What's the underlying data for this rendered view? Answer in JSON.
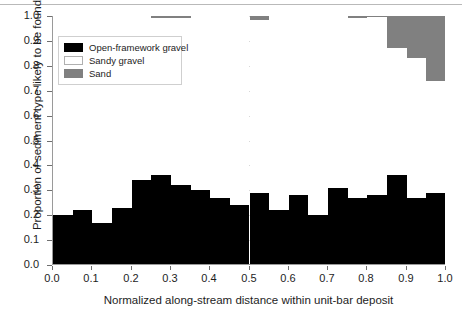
{
  "chart_data": {
    "type": "bar",
    "title": "",
    "subtitle": "",
    "xlabel": "Normalized along-stream distance within unit-bar deposit",
    "ylabel": "Proportion of sediment type likely to be found",
    "xlim": [
      0.0,
      1.0
    ],
    "ylim": [
      0.0,
      1.0
    ],
    "grid": true,
    "stacked": true,
    "legend_position": "upper-left-inside",
    "bar_count": 20,
    "bin_width": 0.05,
    "x_tick_labels": [
      "0.0",
      "0.1",
      "0.2",
      "0.3",
      "0.4",
      "0.5",
      "0.6",
      "0.7",
      "0.8",
      "0.9",
      "1.0"
    ],
    "x_tick_values": [
      0.0,
      0.1,
      0.2,
      0.3,
      0.4,
      0.5,
      0.6,
      0.7,
      0.8,
      0.9,
      1.0
    ],
    "y_tick_labels": [
      "0.0",
      "0.1",
      "0.2",
      "0.3",
      "0.4",
      "0.5",
      "0.6",
      "0.7",
      "0.8",
      "0.9",
      "1.0"
    ],
    "y_tick_values": [
      0.0,
      0.1,
      0.2,
      0.3,
      0.4,
      0.5,
      0.6,
      0.7,
      0.8,
      0.9,
      1.0
    ],
    "bin_centers": [
      0.025,
      0.075,
      0.125,
      0.175,
      0.225,
      0.275,
      0.325,
      0.375,
      0.425,
      0.475,
      0.525,
      0.575,
      0.625,
      0.675,
      0.725,
      0.775,
      0.825,
      0.875,
      0.925,
      0.975
    ],
    "bin_edges": [
      0.0,
      0.05,
      0.1,
      0.15,
      0.2,
      0.25,
      0.3,
      0.35,
      0.4,
      0.45,
      0.5,
      0.55,
      0.6,
      0.65,
      0.7,
      0.75,
      0.8,
      0.85,
      0.9,
      0.95,
      1.0
    ],
    "series": [
      {
        "name": "Open-framework gravel",
        "color": "#000000",
        "values": [
          0.2,
          0.22,
          0.17,
          0.23,
          0.34,
          0.36,
          0.32,
          0.3,
          0.27,
          0.24,
          0.29,
          0.22,
          0.28,
          0.2,
          0.31,
          0.27,
          0.28,
          0.36,
          0.27,
          0.29
        ]
      },
      {
        "name": "Sandy gravel",
        "color": "#ffffff",
        "values": [
          0.8,
          0.78,
          0.83,
          0.77,
          0.66,
          0.63,
          0.67,
          0.7,
          0.73,
          0.76,
          0.695,
          0.78,
          0.72,
          0.8,
          0.69,
          0.72,
          0.715,
          0.51,
          0.56,
          0.45
        ]
      },
      {
        "name": "Sand",
        "color": "#808080",
        "values": [
          0.0,
          0.0,
          0.0,
          0.0,
          0.0,
          0.01,
          0.01,
          0.0,
          0.0,
          0.0,
          0.015,
          0.0,
          0.0,
          0.0,
          0.0,
          0.01,
          0.005,
          0.13,
          0.17,
          0.26
        ]
      }
    ]
  },
  "legend": {
    "items": [
      {
        "label": "Open-framework gravel",
        "swatch": "black"
      },
      {
        "label": "Sandy gravel",
        "swatch": "white"
      },
      {
        "label": "Sand",
        "swatch": "sand"
      }
    ]
  }
}
